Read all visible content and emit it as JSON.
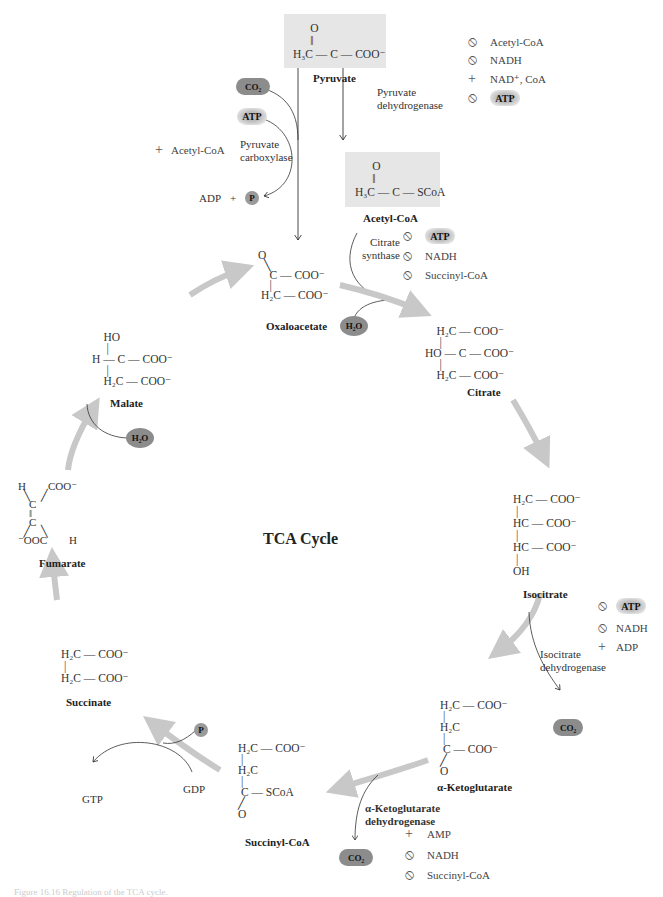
{
  "title": "TCA Cycle",
  "caption": "Figure 16.16 Regulation of the TCA cycle.",
  "colors": {
    "cycle_arrow": "#c8c8c8",
    "shade_box": "#e6e6e6",
    "co2_pill": "#8c8c8c",
    "text": "#2a2a2a"
  },
  "molecules": {
    "pyruvate": {
      "name": "Pyruvate",
      "structure": "      O\n      ‖\nH₃C — C — COO⁻"
    },
    "acetyl_coa": {
      "name": "Acetyl-CoA",
      "structure": "      O\n      ‖\nH₃C — C — SCoA"
    },
    "oxaloacetate": {
      "name": "Oxaloacetate",
      "structure": "O\n  ╲\n    C — COO⁻\n    |\n H₂C — COO⁻"
    },
    "citrate": {
      "name": "Citrate",
      "structure": "    H₂C — COO⁻\n     |\nHO — C — COO⁻\n     |\n    H₂C — COO⁻"
    },
    "isocitrate": {
      "name": "Isocitrate",
      "structure": "H₂C — COO⁻\n |\nHC — COO⁻\n |\nHC — COO⁻\n |\nOH"
    },
    "alpha_ketoglutarate": {
      "name": "α-Ketoglutarate",
      "structure": "H₂C — COO⁻\n |\nH₂C\n |\n C — COO⁻\n╱\nO"
    },
    "succinyl_coa": {
      "name": "Succinyl-CoA",
      "structure": "H₂C — COO⁻\n |\nH₂C\n |\n C — SCoA\n╱\nO"
    },
    "succinate": {
      "name": "Succinate",
      "structure": "H₂C — COO⁻\n |\nH₂C — COO⁻"
    },
    "fumarate": {
      "name": "Fumarate",
      "structure": "H        COO⁻\n  ╲    ╱\n    C\n    ‖\n    C\n  ╱    ╲\n⁻OOC        H"
    },
    "malate": {
      "name": "Malate",
      "structure": "    HO\n     |\nH — C — COO⁻\n     |\n    H₂C — COO⁻"
    }
  },
  "enzymes": {
    "pyruvate_dehydrogenase": "Pyruvate\ndehydrogenase",
    "pyruvate_carboxylase": "Pyruvate\ncarboxylase",
    "citrate_synthase": "Citrate\nsynthase",
    "isocitrate_dehydrogenase": "Isocitrate\ndehydrogenase",
    "akg_dehydrogenase": "α-Ketoglutarate\ndehydrogenase"
  },
  "regulators": {
    "pyruvate_dehydrogenase": [
      {
        "sign": "inhibit",
        "symbol": "⃠",
        "label": "Acetyl-CoA"
      },
      {
        "sign": "inhibit",
        "symbol": "⃠",
        "label": "NADH"
      },
      {
        "sign": "activate",
        "symbol": "+",
        "label": "NAD⁺, CoA"
      },
      {
        "sign": "inhibit",
        "symbol": "⃠",
        "label": "ATP"
      }
    ],
    "pyruvate_carboxylase": [
      {
        "sign": "activate",
        "symbol": "+",
        "label": "Acetyl-CoA"
      }
    ],
    "citrate_synthase": [
      {
        "sign": "inhibit",
        "symbol": "⃠",
        "label": "ATP"
      },
      {
        "sign": "inhibit",
        "symbol": "⃠",
        "label": "NADH"
      },
      {
        "sign": "inhibit",
        "symbol": "⃠",
        "label": "Succinyl-CoA"
      }
    ],
    "isocitrate_dehydrogenase": [
      {
        "sign": "inhibit",
        "symbol": "⃠",
        "label": "ATP"
      },
      {
        "sign": "inhibit",
        "symbol": "⃠",
        "label": "NADH"
      },
      {
        "sign": "activate",
        "symbol": "+",
        "label": "ADP"
      }
    ],
    "akg_dehydrogenase": [
      {
        "sign": "activate",
        "symbol": "+",
        "label": "AMP"
      },
      {
        "sign": "inhibit",
        "symbol": "⃠",
        "label": "NADH"
      },
      {
        "sign": "inhibit",
        "symbol": "⃠",
        "label": "Succinyl-CoA"
      }
    ]
  },
  "cofactors": {
    "co2": "CO₂",
    "atp": "ATP",
    "h2o": "H₂O",
    "p": "P",
    "adp": "ADP",
    "plus": "+",
    "gdp": "GDP",
    "gtp": "GTP"
  },
  "symbols": {
    "inhibit": "⦸",
    "activate": "+"
  }
}
